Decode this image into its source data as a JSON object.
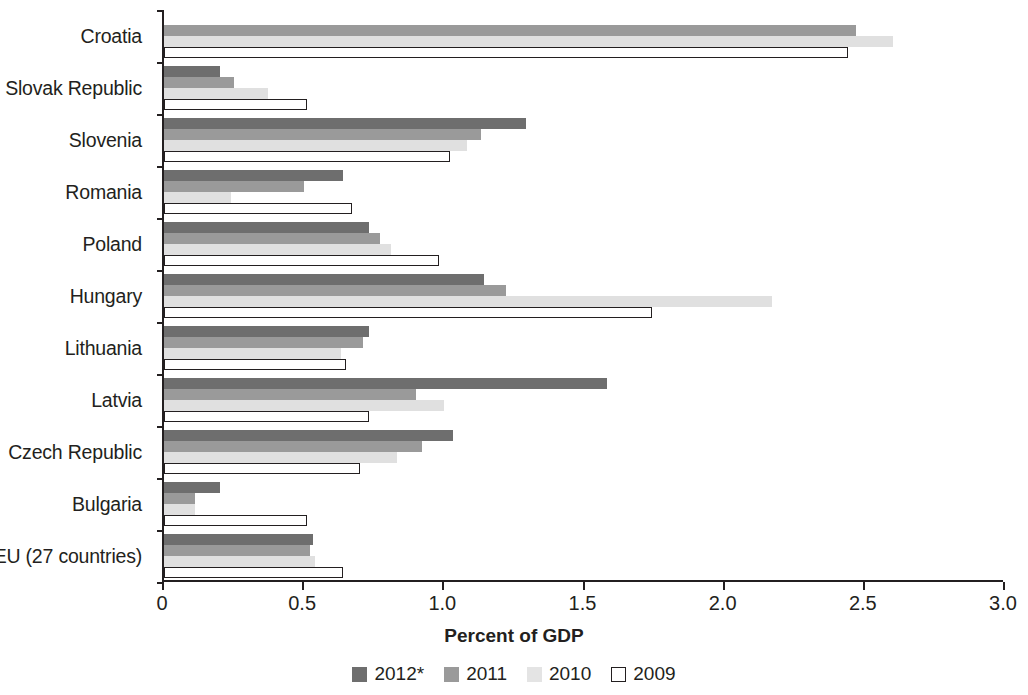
{
  "chart_data": {
    "type": "bar",
    "orientation": "horizontal",
    "title": "",
    "xlabel": "Percent of GDP",
    "ylabel": "",
    "xlim": [
      0,
      3.0
    ],
    "xticks": [
      "0",
      "0.5",
      "1.0",
      "1.5",
      "2.0",
      "2.5",
      "3.0"
    ],
    "xtick_values": [
      0,
      0.5,
      1.0,
      1.5,
      2.0,
      2.5,
      3.0
    ],
    "grid": false,
    "legend_position": "bottom",
    "categories": [
      "Croatia",
      "Slovak Republic",
      "Slovenia",
      "Romania",
      "Poland",
      "Hungary",
      "Lithuania",
      "Latvia",
      "Czech Republic",
      "Bulgaria",
      "EU (27 countries)"
    ],
    "series": [
      {
        "name": "2012*",
        "color": "#6e6e6e",
        "values": [
          null,
          0.2,
          1.29,
          0.64,
          0.73,
          1.14,
          0.73,
          1.58,
          1.03,
          0.2,
          0.53
        ]
      },
      {
        "name": "2011",
        "color": "#9a9a9a",
        "values": [
          2.47,
          0.25,
          1.13,
          0.5,
          0.77,
          1.22,
          0.71,
          0.9,
          0.92,
          0.11,
          0.52
        ]
      },
      {
        "name": "2010",
        "color": "#e0e0e0",
        "values": [
          2.6,
          0.37,
          1.08,
          0.24,
          0.81,
          2.17,
          0.63,
          1.0,
          0.83,
          0.11,
          0.54
        ]
      },
      {
        "name": "2009",
        "color": "#ffffff",
        "values": [
          2.44,
          0.51,
          1.02,
          0.67,
          0.98,
          1.74,
          0.65,
          0.73,
          0.7,
          0.51,
          0.64
        ]
      }
    ]
  },
  "legend": {
    "items": [
      {
        "label": "2012*",
        "key": "y2012"
      },
      {
        "label": "2011",
        "key": "y2011"
      },
      {
        "label": "2010",
        "key": "y2010"
      },
      {
        "label": "2009",
        "key": "y2009"
      }
    ]
  },
  "axis": {
    "x_title": "Percent of GDP"
  }
}
